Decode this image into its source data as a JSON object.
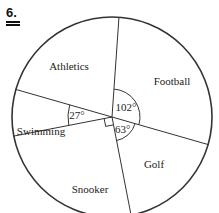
{
  "question_number": "6.",
  "chart_data": {
    "type": "pie",
    "title": "",
    "unit": "degrees",
    "slices": [
      {
        "label": "Football",
        "angle": 102,
        "angle_label": "102°",
        "show_angle": true
      },
      {
        "label": "Golf",
        "angle": 78,
        "angle_label": "",
        "show_angle": false
      },
      {
        "label": "Snooker",
        "angle": 27,
        "angle_label": "27°",
        "show_angle": true
      },
      {
        "label": "Swimming",
        "angle": 90,
        "angle_label": "",
        "show_angle": false,
        "right_angle_mark": true
      },
      {
        "label": "Athletics",
        "angle": 63,
        "angle_label": "63°",
        "show_angle": true
      }
    ],
    "colors": {
      "stroke": "#333333",
      "text": "#222222",
      "fill": "#ffffff"
    }
  }
}
